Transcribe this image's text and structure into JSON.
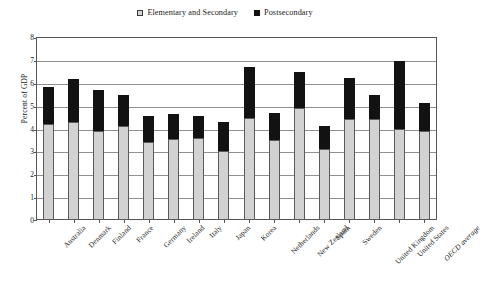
{
  "chart_data": {
    "type": "bar",
    "stacked": true,
    "title": "",
    "xlabel": "",
    "ylabel": "Percent of GDP",
    "ylim": [
      0,
      8
    ],
    "ytick_step": 1,
    "yticks": [
      "0",
      "1",
      "2",
      "3",
      "4",
      "5",
      "6",
      "7",
      "8"
    ],
    "grid": true,
    "legend_position": "top-center",
    "categories": [
      "Australia",
      "Denmark",
      "Finland",
      "France",
      "Germany",
      "Ireland",
      "Italy",
      "Japan",
      "Korea",
      "Netherlands",
      "New Zealand",
      "Spain",
      "Sweden",
      "United Kingdom",
      "United States",
      "OECD average"
    ],
    "italic_categories": [
      "OECD average"
    ],
    "series": [
      {
        "name": "Elementary and Secondary",
        "color": "#d2d2d2",
        "values": [
          4.2,
          4.3,
          3.9,
          4.1,
          3.4,
          3.55,
          3.6,
          3.0,
          4.45,
          3.5,
          4.9,
          3.1,
          4.4,
          4.4,
          4.0,
          3.9
        ]
      },
      {
        "name": "Postsecondary",
        "color": "#121212",
        "values": [
          1.6,
          1.85,
          1.8,
          1.35,
          1.15,
          1.1,
          0.95,
          1.3,
          2.25,
          1.2,
          1.55,
          1.0,
          1.8,
          1.05,
          2.95,
          1.2
        ]
      }
    ],
    "totals": [
      5.8,
      6.15,
      5.7,
      5.45,
      4.55,
      4.65,
      4.55,
      4.3,
      6.7,
      4.7,
      6.45,
      4.1,
      6.2,
      5.45,
      6.95,
      5.1
    ]
  },
  "legend": {
    "entries": [
      {
        "label": "Elementary and Secondary",
        "swatch": "elementary-swatch"
      },
      {
        "label": "Postsecondary",
        "swatch": "postsecondary-swatch"
      }
    ]
  },
  "axis": {
    "y_title": "Percent of GDP"
  }
}
